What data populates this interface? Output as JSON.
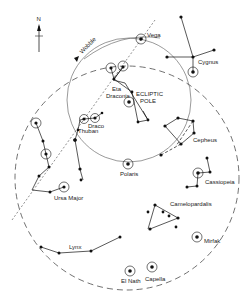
{
  "compass": {
    "label": "N"
  },
  "precession": {
    "label": "Wobble"
  },
  "pole": {
    "label_line1": "ECLIPTIC",
    "label_line2": "POLE"
  },
  "stars": {
    "vega": "Vega",
    "eta_draconis_1": "Eta",
    "eta_draconis_2": "Draconis",
    "thuban": "Thuban",
    "polaris": "Polaris",
    "elnath": "El Nath",
    "capella": "Capella",
    "mirfak": "Mirfak"
  },
  "constellations": {
    "cygnus": "Cygnus",
    "draco": "Draco",
    "cepheus": "Cepheus",
    "cassiopeia": "Cassiopeia",
    "camelopardalis": "Camelopardalis",
    "ursa_major": "Ursa Major",
    "lynx": "Lynx"
  },
  "colors": {
    "ink": "#111111",
    "background": "#ffffff"
  }
}
